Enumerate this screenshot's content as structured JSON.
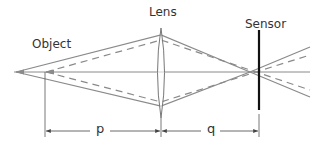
{
  "labels": {
    "object": "Object",
    "lens": "Lens",
    "sensor": "Sensor",
    "object_distance": "p",
    "image_distance": "q"
  },
  "colors": {
    "ray_solid": "#8a8a8a",
    "ray_dashed": "#8a8a8a",
    "sensor": "#111111",
    "lens_outline": "#777777",
    "dimension": "#444444",
    "text": "#333333"
  },
  "geometry": {
    "optical_axis_y": 72,
    "object_x": 16,
    "lens_x": 161,
    "sensor_x": 259,
    "focus_x": 250
  }
}
